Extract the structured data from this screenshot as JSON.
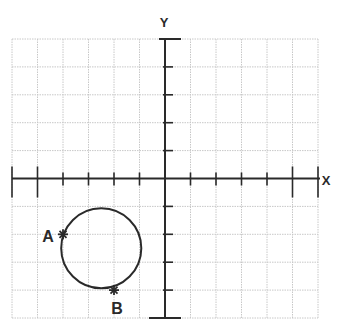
{
  "chart_data": {
    "type": "scatter",
    "title": "",
    "xlabel": "X",
    "ylabel": "Y",
    "xlim": [
      -6,
      6
    ],
    "ylim": [
      -5,
      5
    ],
    "grid": true,
    "tick_labels": false,
    "circle": {
      "center": [
        -2.5,
        -2.5
      ],
      "radius": 1.5
    },
    "points": [
      {
        "label": "A",
        "x": -4,
        "y": -2
      },
      {
        "label": "B",
        "x": -2,
        "y": -4
      }
    ]
  },
  "axes": {
    "x_label": "X",
    "y_label": "Y"
  },
  "points": {
    "a_label": "A",
    "b_label": "B"
  },
  "colors": {
    "grid": "#c8c8c8",
    "axis": "#2a2a2a",
    "curve": "#2a2a2a"
  }
}
